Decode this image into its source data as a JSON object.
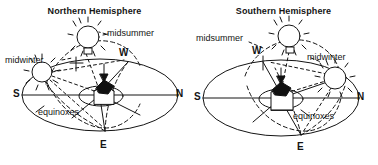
{
  "figure": {
    "name": "celestial-sphere-seasons-diagram",
    "background_color": "#ffffff",
    "ink_color": "#141414",
    "width": 378,
    "height": 165
  },
  "panels": [
    {
      "id": "northern",
      "title": "Northern Hemisphere",
      "sun_labels": {
        "midsummer": "midsummer",
        "midwinter": "midwinter"
      },
      "path_label": "equinoxes",
      "cardinals": {
        "south": "S",
        "north": "N",
        "east": "E",
        "west": "W"
      }
    },
    {
      "id": "southern",
      "title": "Southern Hemisphere",
      "sun_labels": {
        "midsummer": "midsummer",
        "midwinter": "midwinter"
      },
      "path_label": "equinoxes",
      "cardinals": {
        "south": "S",
        "north": "N",
        "east": "E",
        "west": "W"
      }
    }
  ],
  "icons": {
    "sun": "sun-icon",
    "zenith_arrow": "zenith-arrow-icon",
    "observer": "observer-house-icon"
  }
}
